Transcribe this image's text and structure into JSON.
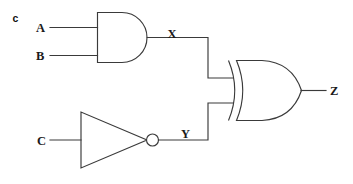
{
  "figure": {
    "part_label": "c",
    "type": "logic-circuit-diagram",
    "ink_color": "#3a3a3a",
    "text_color": "#1a1a1a",
    "background_color": "#ffffff"
  },
  "inputs": [
    {
      "name": "input-a",
      "label": "A"
    },
    {
      "name": "input-b",
      "label": "B"
    },
    {
      "name": "input-c",
      "label": "C"
    }
  ],
  "intermediate_signals": [
    {
      "name": "signal-x",
      "label": "X"
    },
    {
      "name": "signal-y",
      "label": "Y"
    }
  ],
  "outputs": [
    {
      "name": "output-z",
      "label": "Z"
    }
  ],
  "gates": [
    {
      "name": "and-gate",
      "kind": "AND",
      "inputs": [
        "A",
        "B"
      ],
      "output": "X"
    },
    {
      "name": "not-gate",
      "kind": "NOT",
      "inputs": [
        "C"
      ],
      "output": "Y"
    },
    {
      "name": "xor-gate",
      "kind": "XOR",
      "inputs": [
        "X",
        "Y"
      ],
      "output": "Z"
    }
  ]
}
